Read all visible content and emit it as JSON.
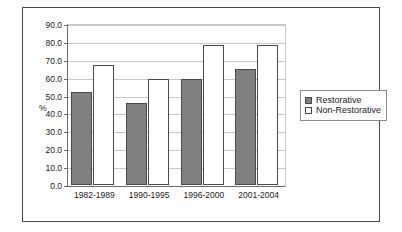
{
  "chart_data": {
    "type": "bar",
    "title": "",
    "xlabel": "",
    "ylabel": "%",
    "ylim": [
      0,
      90
    ],
    "ytick_step": 10,
    "grid": true,
    "legend_position": "right",
    "categories": [
      "1982-1989",
      "1990-1995",
      "1996-2000",
      "2001-2004"
    ],
    "ytick_labels": [
      "90.0",
      "80.0",
      "70.0",
      "60.0",
      "50.0",
      "40.0",
      "30.0",
      "20.0",
      "10.0",
      "0.0"
    ],
    "series": [
      {
        "name": "Restorative",
        "color": "#808080",
        "swatch": "filled",
        "values": [
          52.0,
          46.0,
          59.5,
          65.0
        ]
      },
      {
        "name": "Non-Restorative",
        "color": "#ffffff",
        "swatch": "hollow",
        "values": [
          67.0,
          59.5,
          78.0,
          78.0
        ]
      }
    ]
  },
  "colors": {
    "frame": "#4a4a4a",
    "axis": "#6b6b6b",
    "grid": "#c8c8c8",
    "bar_fill": "#808080",
    "bar_outline": "#4a4a4a",
    "text": "#1a1a1a",
    "background": "#ffffff"
  }
}
